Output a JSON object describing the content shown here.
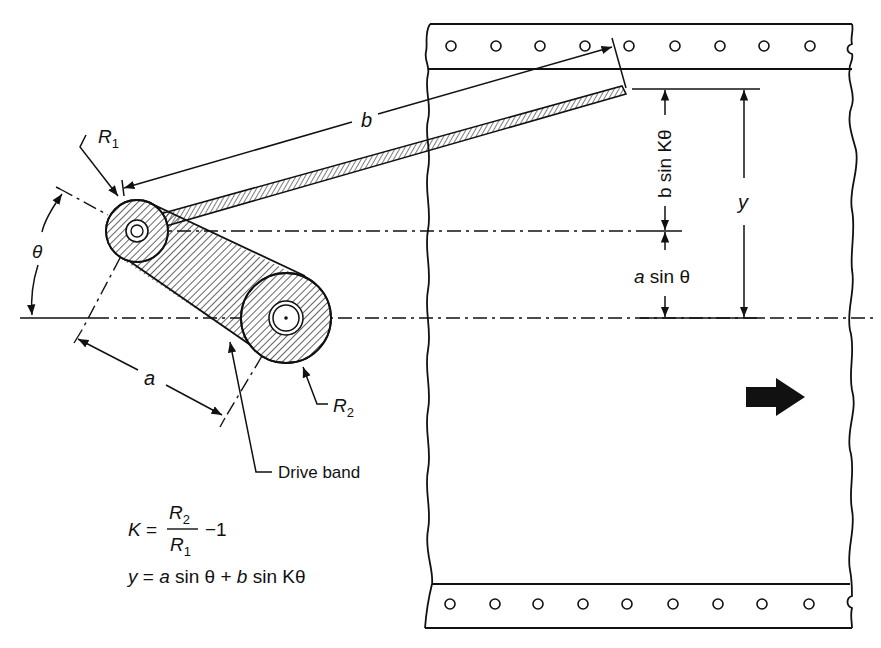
{
  "labels": {
    "r1": "R",
    "r1_sub": "1",
    "r2": "R",
    "r2_sub": "2",
    "theta": "θ",
    "a": "a",
    "b": "b",
    "b_sin_k_theta": "b sin Kθ",
    "a_sin_theta_a": "a",
    "a_sin_theta_rest": " sin θ",
    "y": "y",
    "drive_band": "Drive band"
  },
  "equations": {
    "k_lhs": "K =",
    "k_num": "R",
    "k_num_sub": "2",
    "k_den": "R",
    "k_den_sub": "1",
    "k_rhs": "−1",
    "y_eq_y": "y",
    "y_eq_eq": " = ",
    "y_eq_a": "a",
    "y_eq_sin1": " sin θ + ",
    "y_eq_b": "b",
    "y_eq_sin2": " sin Kθ"
  },
  "tape": {
    "hole_count_top": 9,
    "hole_count_bottom": 9
  },
  "colors": {
    "ink": "#111111",
    "background": "#ffffff"
  }
}
